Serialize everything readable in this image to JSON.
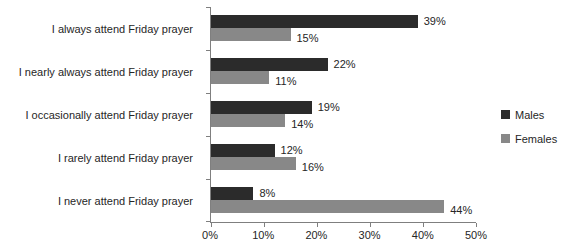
{
  "chart_data": {
    "type": "bar",
    "orientation": "horizontal",
    "categories": [
      "I always attend Friday prayer",
      "I nearly always attend Friday prayer",
      "I occasionally attend Friday prayer",
      "I rarely attend Friday prayer",
      "I never attend Friday prayer"
    ],
    "series": [
      {
        "name": "Males",
        "color": "#2B2B2B",
        "values": [
          39,
          22,
          19,
          12,
          8
        ],
        "labels": [
          "39%",
          "22%",
          "19%",
          "12%",
          "8%"
        ]
      },
      {
        "name": "Females",
        "color": "#888888",
        "values": [
          15,
          11,
          14,
          16,
          44
        ],
        "labels": [
          "15%",
          "11%",
          "14%",
          "16%",
          "44%"
        ]
      }
    ],
    "x_axis": {
      "min": 0,
      "max": 50,
      "tick_labels": [
        "0%",
        "10%",
        "20%",
        "30%",
        "40%",
        "50%"
      ],
      "grid": false
    },
    "legend": {
      "position": "right"
    },
    "axis_color": "#7F7F7F",
    "text_color": "#262626",
    "background": "#FFFFFF"
  }
}
